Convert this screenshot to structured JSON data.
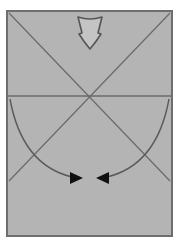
{
  "diagram": {
    "type": "origami-fold-step",
    "colors": {
      "paper_fill": "#b4b4b4",
      "paper_border": "#6e6e6e",
      "crease_line": "#6a6a6a",
      "arrow_stroke": "#5a5a5a",
      "arrowhead_fill": "#111111",
      "hollow_arrow_fill": "#c4c4c4"
    },
    "paper": {
      "x": 7,
      "y": 11,
      "width": 165,
      "height": 225
    },
    "creases": [
      {
        "name": "diagonal-top-left-to-bottom-right",
        "x1": 9,
        "y1": 13,
        "x2": 170,
        "y2": 181
      },
      {
        "name": "diagonal-top-right-to-bottom-left",
        "x1": 170,
        "y1": 13,
        "x2": 9,
        "y2": 181
      },
      {
        "name": "horizontal-midline",
        "x1": 8,
        "y1": 96,
        "x2": 171,
        "y2": 96
      }
    ],
    "push_arrow": {
      "direction": "down",
      "cx": 90,
      "top": 16,
      "bottom": 50
    },
    "fold_arrows": [
      {
        "name": "left-curved-arrow",
        "from": [
          10,
          98
        ],
        "to": [
          80,
          179
        ]
      },
      {
        "name": "right-curved-arrow",
        "from": [
          169,
          98
        ],
        "to": [
          100,
          179
        ]
      }
    ]
  }
}
